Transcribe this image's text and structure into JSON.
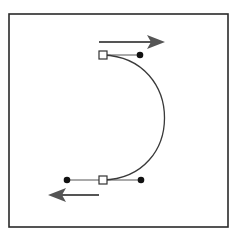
{
  "diagram": {
    "type": "bezier-curve-illustration",
    "colors": {
      "background": "#ffffff",
      "frame": "#2a2a2a",
      "curve": "#3a3a3a",
      "handle_line": "#555555",
      "handle_point": "#111111",
      "anchor_fill": "#ffffff",
      "anchor_stroke": "#333333",
      "arrow": "#555555"
    },
    "frame": {
      "x": 9,
      "y": 14,
      "width": 219,
      "height": 213
    },
    "anchors": [
      {
        "name": "top-anchor",
        "x": 103,
        "y": 55
      },
      {
        "name": "bottom-anchor",
        "x": 103,
        "y": 180
      }
    ],
    "handles": [
      {
        "name": "top-handle-out",
        "x": 140,
        "y": 55
      },
      {
        "name": "bottom-handle-in",
        "x": 141,
        "y": 180
      },
      {
        "name": "bottom-handle-out",
        "x": 67,
        "y": 180
      }
    ],
    "arrows": [
      {
        "name": "top-arrow",
        "direction": "right",
        "x1": 99,
        "x2": 165,
        "y": 42
      },
      {
        "name": "bottom-arrow",
        "direction": "left",
        "x1": 99,
        "x2": 48,
        "y": 195
      }
    ]
  }
}
